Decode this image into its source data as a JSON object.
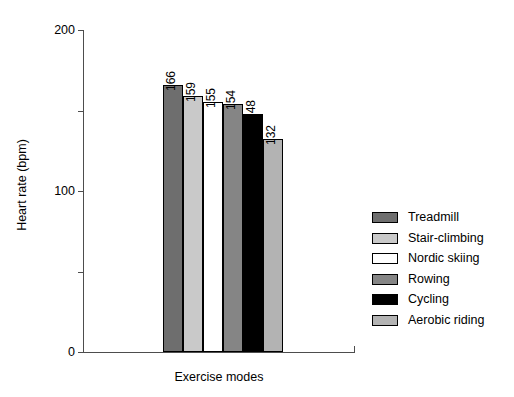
{
  "chart_data": {
    "type": "bar",
    "title": "",
    "xlabel": "Exercise modes",
    "ylabel": "Heart rate (bpm)",
    "categories": [
      "Treadmill",
      "Stair-climbing",
      "Nordic skiing",
      "Rowing",
      "Cycling",
      "Aerobic riding"
    ],
    "values": [
      166,
      159,
      155,
      154,
      148,
      132
    ],
    "value_labels": [
      "166",
      "159",
      "155",
      "154",
      "148",
      "132"
    ],
    "ylim": [
      0,
      200
    ],
    "y_major_ticks": [
      0,
      100,
      200
    ],
    "y_major_tick_labels": [
      "0",
      "100",
      "200"
    ],
    "y_minor_ticks": [
      50,
      150
    ],
    "grid": false,
    "legend_position": "right",
    "bar_colors": [
      "#6e6e6e",
      "#c9c9c9",
      "#ffffff",
      "#858585",
      "#000000",
      "#b3b3b3"
    ],
    "bar_edge_color": "#000000",
    "axis_color": "#4d4d4d",
    "background": "#ffffff",
    "series": [
      {
        "name": "Heart rate",
        "points": [
          {
            "category": "Treadmill",
            "value": 166,
            "color": "#6e6e6e"
          },
          {
            "category": "Stair-climbing",
            "value": 159,
            "color": "#c9c9c9"
          },
          {
            "category": "Nordic skiing",
            "value": 155,
            "color": "#ffffff"
          },
          {
            "category": "Rowing",
            "value": 154,
            "color": "#858585"
          },
          {
            "category": "Cycling",
            "value": 148,
            "color": "#000000"
          },
          {
            "category": "Aerobic riding",
            "value": 132,
            "color": "#b3b3b3"
          }
        ]
      }
    ]
  },
  "legend": {
    "items": [
      {
        "label": "Treadmill",
        "color": "#6e6e6e"
      },
      {
        "label": "Stair-climbing",
        "color": "#c9c9c9"
      },
      {
        "label": "Nordic skiing",
        "color": "#ffffff"
      },
      {
        "label": "Rowing",
        "color": "#858585"
      },
      {
        "label": "Cycling",
        "color": "#000000"
      },
      {
        "label": "Aerobic riding",
        "color": "#b3b3b3"
      }
    ]
  }
}
